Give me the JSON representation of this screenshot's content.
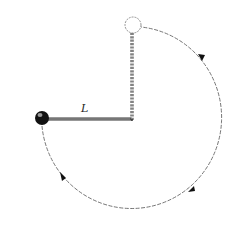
{
  "diagram": {
    "type": "pendulum circular motion",
    "labels": {
      "length": "L"
    },
    "colors": {
      "stroke": "#555555",
      "ball": "#111111",
      "background": "#ffffff"
    },
    "elements": {
      "pivot": {
        "x": 132,
        "y": 120
      },
      "ball": {
        "x": 42,
        "y": 118,
        "r": 7,
        "filled": true
      },
      "top_position": {
        "x": 133,
        "y": 25,
        "r": 8,
        "filled": false
      },
      "path": {
        "center_x": 132,
        "center_y": 120,
        "radius": 91,
        "style": "dashed",
        "direction": "counterclockwise-from-left-through-bottom"
      },
      "arrows": 3
    }
  }
}
